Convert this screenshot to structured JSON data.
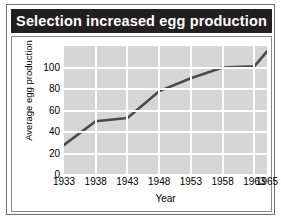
{
  "title": "Selection increased egg production",
  "colors": {
    "title_bar_bg": "#231f20",
    "title_text": "#ffffff",
    "plot_bg": "#d6d6d6",
    "gridline": "#ffffff",
    "line": "#4a4a4a",
    "frame_border": "#6e6e6e",
    "axis_text": "#000000"
  },
  "chart_data": {
    "type": "line",
    "title": "Selection increased egg production",
    "xlabel": "Year",
    "ylabel": "Average egg production",
    "x": [
      1933,
      1938,
      1943,
      1948,
      1953,
      1958,
      1963,
      1965
    ],
    "values": [
      28,
      50,
      53,
      78,
      90,
      100,
      101,
      115
    ],
    "series": [
      {
        "name": "Average egg production",
        "values": [
          28,
          50,
          53,
          78,
          90,
          100,
          101,
          115
        ]
      }
    ],
    "x_tick_labels": [
      "1933",
      "1938",
      "1943",
      "1948",
      "1953",
      "1958",
      "1963",
      "1965"
    ],
    "y_tick_labels": [
      "0",
      "20",
      "40",
      "60",
      "80",
      "100"
    ],
    "y_ticks": [
      0,
      20,
      40,
      60,
      80,
      100
    ],
    "xlim": [
      1933,
      1965
    ],
    "ylim": [
      0,
      120
    ],
    "grid": true,
    "legend": false
  }
}
